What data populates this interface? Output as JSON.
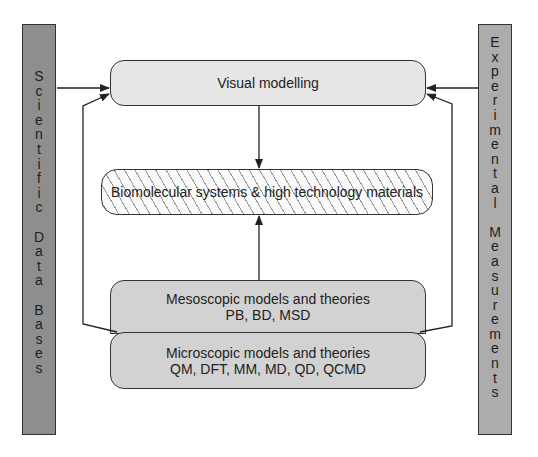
{
  "left_bar": {
    "label": "Scientific Data Bases",
    "chars": [
      "S",
      "c",
      "i",
      "e",
      "n",
      "t",
      "i",
      "f",
      "i",
      "c",
      "",
      "D",
      "a",
      "t",
      "a",
      "",
      "B",
      "a",
      "s",
      "e",
      "s"
    ]
  },
  "right_bar": {
    "label": "Experimental Measurements",
    "chars": [
      "E",
      "x",
      "p",
      "e",
      "r",
      "i",
      "m",
      "e",
      "n",
      "t",
      "a",
      "l",
      "",
      "M",
      "e",
      "a",
      "s",
      "u",
      "r",
      "e",
      "m",
      "e",
      "n",
      "t",
      "s"
    ]
  },
  "boxes": {
    "visual": {
      "line1": "Visual modelling"
    },
    "bio": {
      "line1": "Biomolecular systems  & high technology materials"
    },
    "meso": {
      "line1": "Mesoscopic models and theories",
      "line2": "PB, BD, MSD"
    },
    "micro": {
      "line1": "Microscopic models and theories",
      "line2": "QM, DFT, MM, MD, QD, QCMD"
    }
  },
  "colors": {
    "left_bar": "#8e8e8e",
    "right_bar": "#acacac",
    "visual_box": "#e6e6e6",
    "model_boxes": "#d2d2d2",
    "line": "#222222"
  }
}
